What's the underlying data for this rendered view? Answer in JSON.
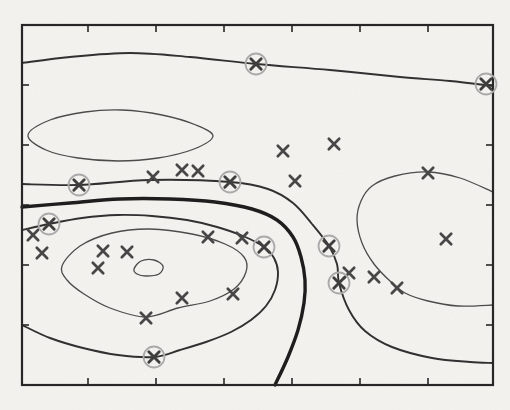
{
  "figure": {
    "title": "",
    "kind": "scanned contour/scatter plot, no text labels visible"
  },
  "chart_data": {
    "type": "scatter",
    "title": "",
    "xlabel": "",
    "ylabel": "",
    "axis_labels_visible": false,
    "legend": "none",
    "grid": false,
    "plot_box_px": {
      "left": 22,
      "top": 25,
      "right": 493,
      "bottom": 385
    },
    "x_ticks_px": [
      88,
      156,
      224,
      292,
      360,
      428
    ],
    "y_ticks_px": [
      85,
      145,
      205,
      265,
      325
    ],
    "tick_length_px": 7,
    "points_px": [
      [
        153,
        177
      ],
      [
        182,
        170
      ],
      [
        198,
        171
      ],
      [
        283,
        151
      ],
      [
        334,
        144
      ],
      [
        295,
        181
      ],
      [
        428,
        173
      ],
      [
        446,
        239
      ],
      [
        33,
        235
      ],
      [
        42,
        253
      ],
      [
        103,
        251
      ],
      [
        127,
        252
      ],
      [
        98,
        268
      ],
      [
        208,
        237
      ],
      [
        242,
        238
      ],
      [
        182,
        298
      ],
      [
        233,
        294
      ],
      [
        146,
        318
      ],
      [
        349,
        273
      ],
      [
        374,
        277
      ],
      [
        397,
        288
      ]
    ],
    "support_vectors_px": [
      [
        256,
        64
      ],
      [
        486,
        84
      ],
      [
        79,
        185
      ],
      [
        230,
        182
      ],
      [
        49,
        224
      ],
      [
        264,
        247
      ],
      [
        329,
        246
      ],
      [
        339,
        283
      ],
      [
        154,
        357
      ]
    ],
    "contours": [
      {
        "name": "upper-contour",
        "weight": "medium",
        "closed": false,
        "points": [
          [
            22,
            63
          ],
          [
            70,
            57
          ],
          [
            130,
            53
          ],
          [
            190,
            57
          ],
          [
            256,
            64
          ],
          [
            330,
            70
          ],
          [
            400,
            77
          ],
          [
            450,
            81
          ],
          [
            493,
            86
          ]
        ]
      },
      {
        "name": "upper-left-ellipse",
        "weight": "thin",
        "closed": true,
        "points": [
          [
            28,
            135
          ],
          [
            50,
            120
          ],
          [
            85,
            112
          ],
          [
            122,
            110
          ],
          [
            162,
            115
          ],
          [
            196,
            125
          ],
          [
            213,
            136
          ],
          [
            194,
            149
          ],
          [
            158,
            158
          ],
          [
            118,
            161
          ],
          [
            78,
            158
          ],
          [
            46,
            150
          ]
        ]
      },
      {
        "name": "mid-contour",
        "weight": "medium",
        "closed": false,
        "points": [
          [
            22,
            184
          ],
          [
            79,
            185
          ],
          [
            150,
            180
          ],
          [
            230,
            182
          ],
          [
            268,
            189
          ],
          [
            293,
            203
          ],
          [
            312,
            224
          ],
          [
            329,
            246
          ],
          [
            337,
            264
          ],
          [
            339,
            283
          ],
          [
            349,
            310
          ],
          [
            365,
            331
          ],
          [
            392,
            347
          ],
          [
            432,
            358
          ],
          [
            470,
            362
          ],
          [
            493,
            363
          ]
        ]
      },
      {
        "name": "decision-boundary",
        "weight": "thick",
        "closed": false,
        "points": [
          [
            22,
            207
          ],
          [
            70,
            203
          ],
          [
            120,
            199
          ],
          [
            170,
            199
          ],
          [
            215,
            202
          ],
          [
            252,
            209
          ],
          [
            277,
            220
          ],
          [
            293,
            237
          ],
          [
            301,
            257
          ],
          [
            305,
            280
          ],
          [
            304,
            303
          ],
          [
            298,
            330
          ],
          [
            288,
            357
          ],
          [
            275,
            385
          ]
        ]
      },
      {
        "name": "inner-c-loop",
        "weight": "medium",
        "closed": false,
        "points": [
          [
            22,
            230
          ],
          [
            49,
            224
          ],
          [
            82,
            218
          ],
          [
            118,
            215
          ],
          [
            152,
            216
          ],
          [
            187,
            220
          ],
          [
            217,
            227
          ],
          [
            243,
            236
          ],
          [
            264,
            247
          ],
          [
            274,
            258
          ],
          [
            278,
            272
          ],
          [
            275,
            290
          ],
          [
            266,
            306
          ],
          [
            251,
            320
          ],
          [
            231,
            332
          ],
          [
            206,
            342
          ],
          [
            180,
            350
          ],
          [
            154,
            357
          ],
          [
            118,
            355
          ],
          [
            83,
            348
          ],
          [
            50,
            338
          ],
          [
            22,
            325
          ]
        ]
      },
      {
        "name": "inner-ellipse",
        "weight": "thin",
        "closed": true,
        "points": [
          [
            62,
            266
          ],
          [
            80,
            246
          ],
          [
            112,
            233
          ],
          [
            150,
            229
          ],
          [
            192,
            234
          ],
          [
            225,
            244
          ],
          [
            244,
            257
          ],
          [
            246,
            272
          ],
          [
            234,
            289
          ],
          [
            210,
            301
          ],
          [
            178,
            308
          ],
          [
            146,
            317
          ],
          [
            110,
            308
          ],
          [
            84,
            294
          ],
          [
            67,
            280
          ]
        ]
      },
      {
        "name": "innermost-blob",
        "weight": "thin",
        "closed": true,
        "points": [
          [
            134,
            269
          ],
          [
            141,
            261
          ],
          [
            154,
            260
          ],
          [
            163,
            266
          ],
          [
            159,
            274
          ],
          [
            146,
            276
          ],
          [
            137,
            274
          ]
        ]
      },
      {
        "name": "right-c-curve",
        "weight": "thin",
        "closed": false,
        "points": [
          [
            493,
            192
          ],
          [
            460,
            178
          ],
          [
            428,
            172
          ],
          [
            395,
            176
          ],
          [
            372,
            186
          ],
          [
            361,
            201
          ],
          [
            357,
            220
          ],
          [
            362,
            243
          ],
          [
            374,
            264
          ],
          [
            390,
            281
          ],
          [
            405,
            293
          ],
          [
            428,
            301
          ],
          [
            458,
            306
          ],
          [
            493,
            305
          ]
        ]
      }
    ],
    "colors": {
      "background": "#f5f4f0",
      "axis": "#242424",
      "line_thin": "#4a4a4a",
      "line_medium": "#2e2e2e",
      "line_thick": "#1b1b1b",
      "marker": "#454545",
      "sv_marker": "#3c3c3c",
      "sv_circle": "#ababab"
    },
    "marker_style": {
      "glyph": "x",
      "half_size_px": 5.2,
      "sv_circle_radius_px": 10.5
    }
  }
}
